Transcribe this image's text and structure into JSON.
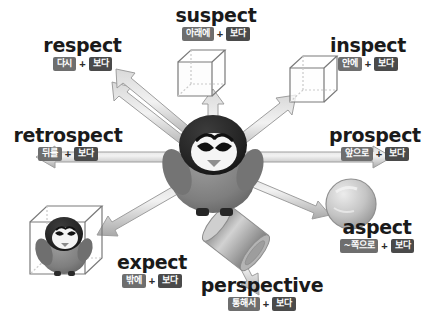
{
  "diagram": {
    "title_word_root": "spect",
    "center_character": "angry-penguin",
    "background_color": "#ffffff",
    "tag_color_prefix": "#6e6e6e",
    "tag_color_root": "#4a4a4a",
    "arrow_color": "#b8b8b8",
    "root_meaning": "보다",
    "entries": [
      {
        "id": "suspect",
        "word": "suspect",
        "prefix": "아래에",
        "plus": "+",
        "root": "보다",
        "object": "wireframe-cube",
        "arrow_direction": "up"
      },
      {
        "id": "respect",
        "word": "respect",
        "prefix": "다시",
        "plus": "+",
        "root": "보다",
        "object": "double-arrow-back",
        "arrow_direction": "up-left"
      },
      {
        "id": "inspect",
        "word": "inspect",
        "prefix": "안에",
        "plus": "+",
        "root": "보다",
        "object": "wireframe-cube-arrow-inside",
        "arrow_direction": "up-right"
      },
      {
        "id": "retrospect",
        "word": "retrospect",
        "prefix": "뒤를",
        "plus": "+",
        "root": "보다",
        "object": "left-arrow",
        "arrow_direction": "left"
      },
      {
        "id": "prospect",
        "word": "prospect",
        "prefix": "앞으로",
        "plus": "+",
        "root": "보다",
        "object": "right-arrow",
        "arrow_direction": "right"
      },
      {
        "id": "aspect",
        "word": "aspect",
        "prefix": "~쪽으로",
        "plus": "+",
        "root": "보다",
        "object": "sphere",
        "arrow_direction": "down-right"
      },
      {
        "id": "perspective",
        "word": "perspective",
        "prefix": "통해서",
        "plus": "+",
        "root": "보다",
        "object": "cylinder-through",
        "arrow_direction": "down"
      },
      {
        "id": "expect",
        "word": "expect",
        "prefix": "밖에",
        "plus": "+",
        "root": "보다",
        "object": "cube-with-penguin-inside",
        "arrow_direction": "down-left-outward"
      }
    ]
  }
}
